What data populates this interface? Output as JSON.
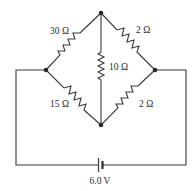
{
  "diagram": {
    "type": "circuit",
    "resistors": [
      {
        "id": "r-top-left",
        "label": "30 Ω",
        "from": "left-node",
        "to": "top-node"
      },
      {
        "id": "r-top-right",
        "label": "2 Ω",
        "from": "top-node",
        "to": "right-node"
      },
      {
        "id": "r-middle",
        "label": "10 Ω",
        "from": "top-node",
        "to": "bottom-node"
      },
      {
        "id": "r-bottom-left",
        "label": "15 Ω",
        "from": "left-node",
        "to": "bottom-node"
      },
      {
        "id": "r-bottom-right",
        "label": "2 Ω",
        "from": "bottom-node",
        "to": "right-node"
      }
    ],
    "battery": {
      "label": "6.0 V"
    },
    "nodes": [
      "top-node",
      "left-node",
      "right-node",
      "bottom-node"
    ]
  }
}
